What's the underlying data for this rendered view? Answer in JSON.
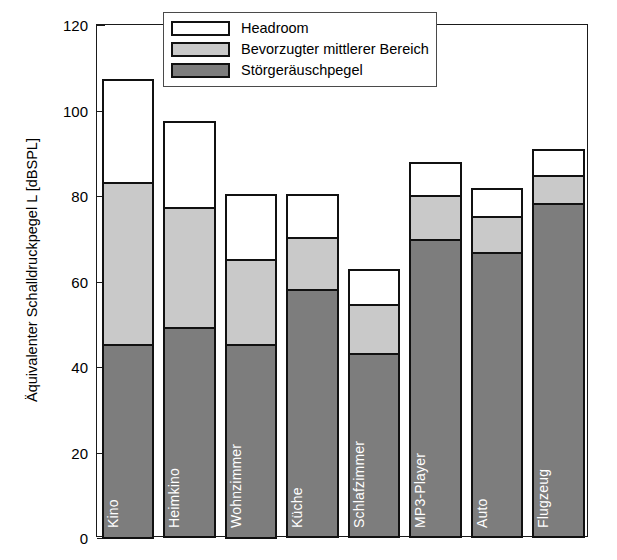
{
  "chart_data": {
    "type": "bar",
    "subtype": "stacked-bar",
    "title": "",
    "xlabel": "",
    "ylabel": "Äquivalenter Schalldruckpegel L [dBSPL]",
    "ylim": [
      0,
      120
    ],
    "yticks": [
      0,
      20,
      40,
      60,
      80,
      100,
      120
    ],
    "ytick_labels": [
      "0",
      "20",
      "40",
      "60",
      "80",
      "100",
      "120"
    ],
    "grid": false,
    "legend_position": "top-right-inside",
    "categories": [
      "Kino",
      "Heimkino",
      "Wohnzimmer",
      "Küche",
      "Schlafzimmer",
      "MP3-Player",
      "Auto",
      "Flugzeug"
    ],
    "series": [
      {
        "name": "Störgeräuschpegel",
        "color": "#7d7d7d",
        "values": [
          45,
          49,
          45,
          58,
          43,
          69.5,
          66.5,
          78
        ]
      },
      {
        "name": "Bevorzugter mittlerer Bereich",
        "color": "#c9c9c9",
        "values": [
          38,
          28,
          20,
          12,
          11.5,
          10.5,
          8.5,
          6.5
        ]
      },
      {
        "name": "Headroom",
        "color": "#ffffff",
        "values": [
          24,
          20,
          15,
          10,
          8,
          7.5,
          6.5,
          6
        ]
      }
    ],
    "cumulative_tops": {
      "Störgeräuschpegel": [
        45,
        49,
        45,
        58,
        43,
        69.5,
        66.5,
        78
      ],
      "Bevorzugter mittlerer Bereich": [
        83,
        77,
        65,
        70,
        54.5,
        80,
        75,
        84.5
      ],
      "Headroom": [
        107,
        97,
        80,
        80,
        62.5,
        87.5,
        81.5,
        90.5
      ]
    }
  },
  "legend": {
    "items": [
      {
        "label": "Headroom",
        "swatch": "head"
      },
      {
        "label": "Bevorzugter mittlerer Bereich",
        "swatch": "mid"
      },
      {
        "label": "Störgeräuschpegel",
        "swatch": "noise"
      }
    ]
  },
  "axis": {
    "y_title": "Äquivalenter Schalldruckpegel L [dBSPL]"
  }
}
